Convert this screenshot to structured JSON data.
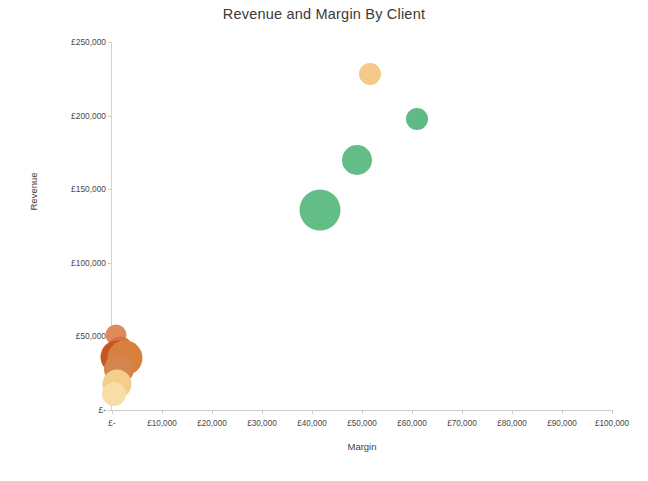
{
  "chart": {
    "title": "Revenue and Margin By Client",
    "x_axis_title": "Margin",
    "y_axis_title": "Revenue"
  },
  "chart_data": {
    "type": "scatter",
    "title": "Revenue and Margin By Client",
    "subtitle": "",
    "xlabel": "Margin",
    "ylabel": "Revenue",
    "xlim": [
      0,
      100000
    ],
    "ylim": [
      0,
      250000
    ],
    "grid": false,
    "legend": false,
    "legend_position": "none",
    "x_tick_labels": [
      "£-",
      "£10,000",
      "£20,000",
      "£30,000",
      "£40,000",
      "£50,000",
      "£60,000",
      "£70,000",
      "£80,000",
      "£90,000",
      "£100,000"
    ],
    "x_tick_values": [
      0,
      10000,
      20000,
      30000,
      40000,
      50000,
      60000,
      70000,
      80000,
      90000,
      100000
    ],
    "y_tick_labels": [
      "£-",
      "£50,000",
      "£100,000",
      "£150,000",
      "£200,000",
      "£250,000"
    ],
    "y_tick_values": [
      0,
      50000,
      100000,
      150000,
      200000,
      250000
    ],
    "points": [
      {
        "name": "client-peach-top",
        "x": 51500,
        "y": 228000,
        "size": 22,
        "color": "#f5c98a"
      },
      {
        "name": "client-green-right",
        "x": 61000,
        "y": 198000,
        "size": 22,
        "color": "#5fbb83"
      },
      {
        "name": "client-green-mid",
        "x": 49000,
        "y": 170000,
        "size": 30,
        "color": "#64bd86"
      },
      {
        "name": "client-green-large",
        "x": 41500,
        "y": 136000,
        "size": 41,
        "color": "#62bd87"
      },
      {
        "name": "client-tan-small",
        "x": 700,
        "y": 51000,
        "size": 21,
        "color": "#e08a5b"
      },
      {
        "name": "client-brown-a",
        "x": 1600,
        "y": 41000,
        "size": 27,
        "color": "#d2763f"
      },
      {
        "name": "client-brown-dark",
        "x": 900,
        "y": 36000,
        "size": 33,
        "color": "#c6561f"
      },
      {
        "name": "client-brown-b",
        "x": 2600,
        "y": 35000,
        "size": 35,
        "color": "#d8813f"
      },
      {
        "name": "client-brown-c",
        "x": 1400,
        "y": 28000,
        "size": 30,
        "color": "#d4854d"
      },
      {
        "name": "client-yellow-a",
        "x": 900,
        "y": 18000,
        "size": 29,
        "color": "#f3cf8a"
      },
      {
        "name": "client-yellow-b",
        "x": 400,
        "y": 11000,
        "size": 24,
        "color": "#f7dda6"
      }
    ]
  }
}
